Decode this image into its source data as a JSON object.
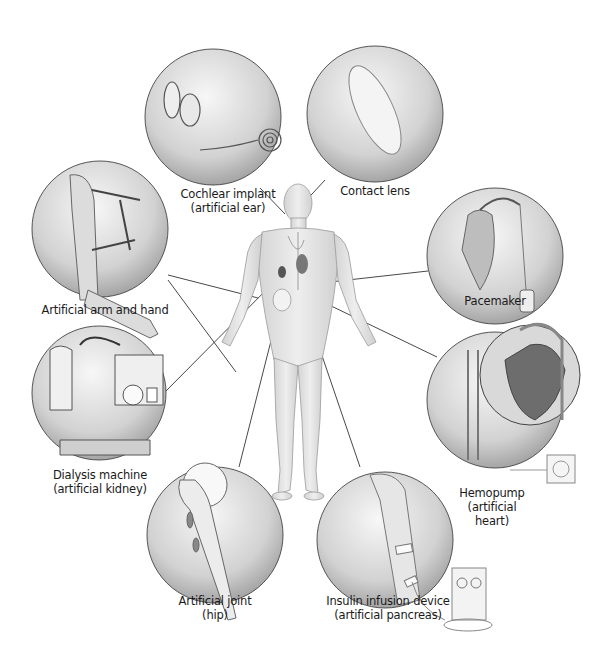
{
  "figure": {
    "central_figure": "human-body",
    "callouts": [
      {
        "id": "cochlear",
        "lines": [
          "Cochlear implant",
          "(artificial ear)"
        ],
        "target": "ear"
      },
      {
        "id": "contact",
        "lines": [
          "Contact lens"
        ],
        "target": "eye"
      },
      {
        "id": "arm",
        "lines": [
          "Artificial arm and hand"
        ],
        "target": "arm"
      },
      {
        "id": "pacemaker",
        "lines": [
          "Pacemaker"
        ],
        "target": "heart"
      },
      {
        "id": "dialysis",
        "lines": [
          "Dialysis machine",
          "(artificial kidney)"
        ],
        "target": "kidney"
      },
      {
        "id": "hemopump",
        "lines": [
          "Hemopump",
          "(artificial",
          "heart)"
        ],
        "target": "heart"
      },
      {
        "id": "hip",
        "lines": [
          "Artificial joint",
          "(hip)"
        ],
        "target": "hip"
      },
      {
        "id": "insulin",
        "lines": [
          "Insulin infusion device",
          "(artificial pancreas)"
        ],
        "target": "pancreas"
      }
    ]
  },
  "colors": {
    "line": "#333333",
    "circle_edge": "#444444",
    "body_fill": "#e6e6e6",
    "body_edge": "#9a9a9a",
    "organ_dark": "#555555"
  }
}
